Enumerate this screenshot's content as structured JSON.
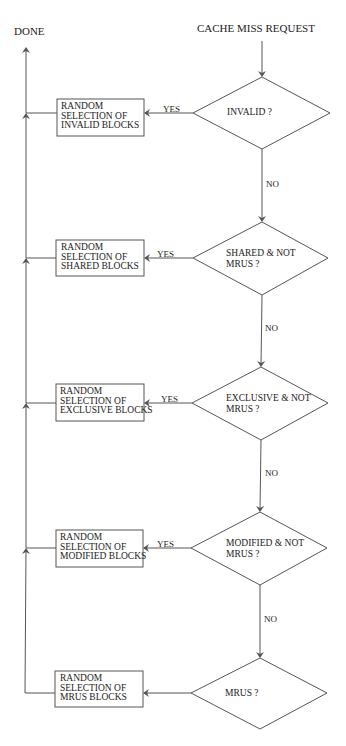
{
  "diagram": {
    "type": "flowchart",
    "start_label": "CACHE MISS REQUEST",
    "end_label": "DONE",
    "decisions": [
      {
        "id": "d1",
        "line1": "INVALID ?",
        "line2": "",
        "yes_label": "YES",
        "no_label": "NO"
      },
      {
        "id": "d2",
        "line1": "SHARED & NOT",
        "line2": "MRUS ?",
        "yes_label": "YES",
        "no_label": "NO"
      },
      {
        "id": "d3",
        "line1": "EXCLUSIVE & NOT",
        "line2": "MRUS ?",
        "yes_label": "YES",
        "no_label": "NO"
      },
      {
        "id": "d4",
        "line1": "MODIFIED & NOT",
        "line2": "MRUS ?",
        "yes_label": "YES",
        "no_label": "NO"
      },
      {
        "id": "d5",
        "line1": "MRUS ?",
        "line2": "",
        "yes_label": "",
        "no_label": ""
      }
    ],
    "actions": [
      {
        "id": "a1",
        "lines": [
          "RANDOM",
          "SELECTION OF",
          "INVALID BLOCKS"
        ]
      },
      {
        "id": "a2",
        "lines": [
          "RANDOM",
          "SELECTION OF",
          "SHARED BLOCKS"
        ]
      },
      {
        "id": "a3",
        "lines": [
          "RANDOM",
          "SELECTION OF",
          "EXCLUSIVE BLOCKS"
        ]
      },
      {
        "id": "a4",
        "lines": [
          "RANDOM",
          "SELECTION OF",
          "MODIFIED BLOCKS"
        ]
      },
      {
        "id": "a5",
        "lines": [
          "RANDOM",
          "SELECTION OF",
          "MRUS BLOCKS"
        ]
      }
    ],
    "edges": [
      {
        "from": "start",
        "to": "d1"
      },
      {
        "from": "d1",
        "to": "a1",
        "label": "YES"
      },
      {
        "from": "d1",
        "to": "d2",
        "label": "NO"
      },
      {
        "from": "d2",
        "to": "a2",
        "label": "YES"
      },
      {
        "from": "d2",
        "to": "d3",
        "label": "NO"
      },
      {
        "from": "d3",
        "to": "a3",
        "label": "YES"
      },
      {
        "from": "d3",
        "to": "d4",
        "label": "NO"
      },
      {
        "from": "d4",
        "to": "a4",
        "label": "YES"
      },
      {
        "from": "d4",
        "to": "d5",
        "label": "NO"
      },
      {
        "from": "d5",
        "to": "a5",
        "label": ""
      },
      {
        "from": "a1",
        "to": "done"
      },
      {
        "from": "a2",
        "to": "done"
      },
      {
        "from": "a3",
        "to": "done"
      },
      {
        "from": "a4",
        "to": "done"
      },
      {
        "from": "a5",
        "to": "done"
      }
    ],
    "colors": {
      "line": "#555555",
      "text": "#222222",
      "background": "#ffffff"
    }
  }
}
